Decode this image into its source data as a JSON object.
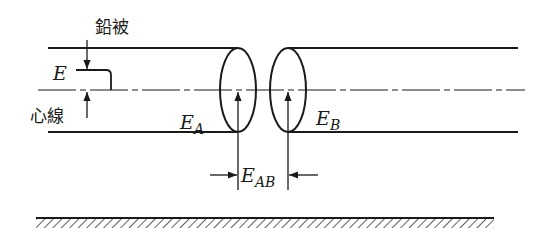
{
  "diagram": {
    "labels": {
      "sheath": "鉛被",
      "core": "心線",
      "E": "E",
      "EA_main": "E",
      "EA_sub": "A",
      "EB_main": "E",
      "EB_sub": "B",
      "EAB_main": "E",
      "EAB_sub": "AB"
    },
    "components": [
      "left-cable-tube",
      "right-cable-tube",
      "center-axis-dash-dot",
      "ground-hatched-plane"
    ],
    "colors": {
      "ink": "#1a1a1a",
      "background": "#ffffff"
    }
  }
}
